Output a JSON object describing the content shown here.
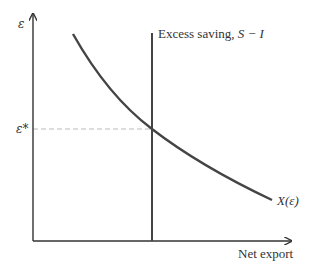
{
  "diagram": {
    "y_axis_label": "ε",
    "x_axis_label": "Net export",
    "equilibrium_label": "ε*",
    "vertical_line_label_text": "Excess saving, ",
    "vertical_line_label_math": "S − I",
    "curve_label": "X(ε)",
    "colors": {
      "axis": "#333333",
      "curve": "#444444",
      "dashed": "#bbbbbb"
    }
  }
}
